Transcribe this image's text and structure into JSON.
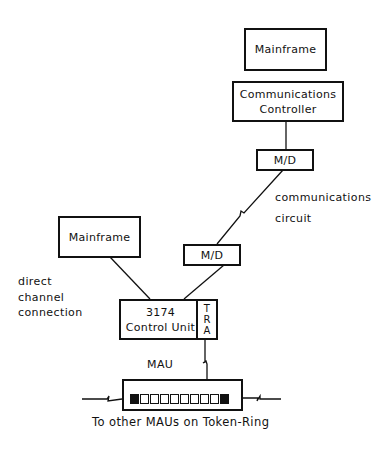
{
  "diagram": {
    "nodes": {
      "mainframe_top": {
        "label": "Mainframe"
      },
      "comm_controller": {
        "line1": "Communications",
        "line2": "Controller"
      },
      "md_upper": {
        "label": "M/D"
      },
      "md_lower": {
        "label": "M/D"
      },
      "mainframe_left": {
        "label": "Mainframe"
      },
      "control_unit": {
        "line1": "3174",
        "line2": "Control Unit",
        "tra": [
          "T",
          "R",
          "A"
        ]
      },
      "mau": {
        "label": "MAU",
        "port_count": 10,
        "filled_ports": [
          0,
          9
        ],
        "connected_port": 7
      }
    },
    "annotations": {
      "comm_circuit": {
        "line1": "communications",
        "line2": "circuit"
      },
      "direct_channel": {
        "line1": "direct",
        "line2": "channel",
        "line3": "connection"
      },
      "footer": "To other MAUs on Token-Ring"
    },
    "colors": {
      "stroke": "#111111",
      "background": "#ffffff"
    }
  }
}
